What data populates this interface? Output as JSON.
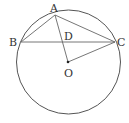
{
  "diagram": {
    "type": "geometry",
    "circle": {
      "center": "O",
      "cx": 68.5,
      "cy": 62,
      "r": 52
    },
    "points": {
      "A": {
        "label": "A",
        "x": 55,
        "y": 15
      },
      "B": {
        "label": "B",
        "x": 21,
        "y": 42
      },
      "C": {
        "label": "C",
        "x": 115,
        "y": 42
      },
      "D": {
        "label": "D",
        "x": 61,
        "y": 42
      },
      "O": {
        "label": "O",
        "x": 68,
        "y": 62
      }
    },
    "segments": [
      "AB",
      "AC",
      "BC",
      "AO",
      "OC"
    ],
    "colors": {
      "stroke": "#555555",
      "text": "#333333"
    }
  }
}
